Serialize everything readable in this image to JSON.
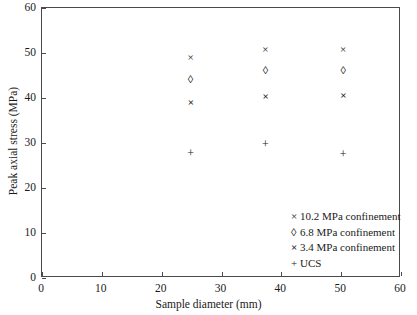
{
  "chart_data": {
    "type": "scatter",
    "title": "",
    "xlabel": "Sample diameter (mm)",
    "ylabel": "Peak axial stress (MPa)",
    "xlim": [
      0,
      60
    ],
    "ylim": [
      0,
      60
    ],
    "xticks": [
      0,
      10,
      20,
      30,
      40,
      50,
      60
    ],
    "yticks": [
      0,
      10,
      20,
      30,
      40,
      50,
      60
    ],
    "grid": false,
    "legend_position": "lower-right",
    "series": [
      {
        "name": "10.2 MPa confinement",
        "marker": "x",
        "points": [
          {
            "x": 25.0,
            "y": 48.8
          },
          {
            "x": 37.5,
            "y": 50.7
          },
          {
            "x": 50.5,
            "y": 50.6
          }
        ]
      },
      {
        "name": "6.8 MPa confinement",
        "marker": "diamond-open",
        "points": [
          {
            "x": 25.0,
            "y": 44.0
          },
          {
            "x": 37.5,
            "y": 46.0
          },
          {
            "x": 50.5,
            "y": 46.0
          }
        ]
      },
      {
        "name": "3.4 MPa confinement",
        "marker": "x-bold",
        "points": [
          {
            "x": 25.0,
            "y": 38.9
          },
          {
            "x": 37.5,
            "y": 40.2
          },
          {
            "x": 50.5,
            "y": 40.5
          }
        ]
      },
      {
        "name": "UCS",
        "marker": "plus",
        "points": [
          {
            "x": 25.0,
            "y": 27.5
          },
          {
            "x": 37.5,
            "y": 29.6
          },
          {
            "x": 50.5,
            "y": 27.3
          }
        ]
      }
    ]
  },
  "axes": {
    "x": {
      "label": "Sample diameter (mm)",
      "ticks": [
        "0",
        "10",
        "20",
        "30",
        "40",
        "50",
        "60"
      ]
    },
    "y": {
      "label": "Peak axial stress (MPa)",
      "ticks": [
        "0",
        "10",
        "20",
        "30",
        "40",
        "50",
        "60"
      ]
    }
  },
  "legend": {
    "items": [
      {
        "symbol": "×",
        "label": "10.2 MPa confinement",
        "bold": false
      },
      {
        "symbol": "◊",
        "label": "6.8 MPa confinement",
        "bold": false
      },
      {
        "symbol": "×",
        "label": "3.4 MPa confinement",
        "bold": true
      },
      {
        "symbol": "+",
        "label": "UCS",
        "bold": false
      }
    ]
  },
  "colors": {
    "ink": "#1a1a1a",
    "axis": "#4a4a4a",
    "background": "#ffffff"
  }
}
